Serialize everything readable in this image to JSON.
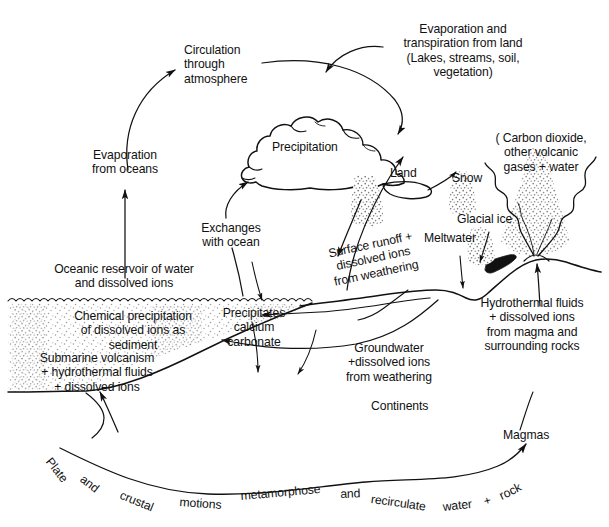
{
  "figure": {
    "kind": "scientific-diagram",
    "line_color": "#111111",
    "stipple_color": "#a9a9a9",
    "background": "#ffffff"
  },
  "labels": {
    "circulation_through_atmosphere": "Circulation\nthrough\natmosphere",
    "evaporation_and_transpiration": "Evaporation and\ntranspiration from land\n(Lakes, streams, soil,\nvegetation)",
    "evaporation_from_oceans": "Evaporation\nfrom oceans",
    "precipitation": "Precipitation",
    "land": "Land",
    "carbon_dioxide_gases": "( Carbon dioxide,\nother volcanic\ngases + water",
    "snow": "Snow",
    "glacial_ice": "Glacial ice",
    "meltwater": "Meltwater",
    "exchanges_with_ocean": "Exchanges\nwith ocean",
    "surface_runoff": "Surface runoff +\ndissolved ions\nfrom weathering",
    "oceanic_reservoir": "Oceanic reservoir of water\nand dissolved ions",
    "precipitates_calcium_carbonate": "Precipitates\ncalcium\ncarbonate",
    "chemical_precipitation": "Chemical precipitation\nof dissolved ions as\nsediment",
    "submarine_volcanism": "Submarine volcanism\n+ hydrothermal fluids\n+ dissolved ions",
    "groundwater": "Groundwater\n+dissolved ions\nfrom weathering",
    "hydrothermal_fluids": "Hydrothermal fluids\n+ dissolved ions\nfrom magma and\nsurrounding rocks",
    "continents": "Continents",
    "magmas": "Magmas"
  },
  "curved_caption": {
    "full_text": "Plate and crustal motions metamorphose and recirculate water + rock",
    "words": [
      {
        "text": "Plate",
        "x": 54,
        "y": 455,
        "rot": 52
      },
      {
        "text": "and",
        "x": 86,
        "y": 472,
        "rot": 38
      },
      {
        "text": "crustal",
        "x": 123,
        "y": 488,
        "rot": 22
      },
      {
        "text": "motions",
        "x": 180,
        "y": 495,
        "rot": 4
      },
      {
        "text": "metamorphose",
        "x": 240,
        "y": 489,
        "rot": -5
      },
      {
        "text": "and",
        "x": 340,
        "y": 487,
        "rot": -2
      },
      {
        "text": "recirculate",
        "x": 372,
        "y": 492,
        "rot": 8
      },
      {
        "text": "water",
        "x": 442,
        "y": 500,
        "rot": -6
      },
      {
        "text": "+",
        "x": 482,
        "y": 495,
        "rot": -16
      },
      {
        "text": "rock",
        "x": 497,
        "y": 490,
        "rot": -26
      }
    ]
  },
  "elements": {
    "cloud": "cumulus-cloud-outline",
    "ocean_body": "stippled-ocean-basin",
    "ocean_surface": "scalloped-wave-line",
    "volcano_plume": "stippled-eruption-plume",
    "snow_patch": "stippled-snow",
    "glacial_ice_patch": "stippled-glacial-ice",
    "rain_shaft": "stippled-precipitation-fall",
    "terrain_profile": "continent-land-surface-line",
    "subduction_curve": "plate-motion-curve"
  }
}
